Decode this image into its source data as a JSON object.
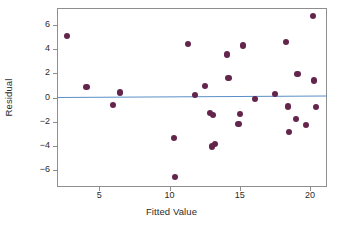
{
  "chart_data": {
    "type": "scatter",
    "title": "",
    "xlabel": "Fitted Value",
    "ylabel": "Residual",
    "xlim": [
      2.0,
      21.2
    ],
    "ylim": [
      -7.4,
      7.4
    ],
    "xticks": [
      5,
      10,
      15,
      20
    ],
    "yticks": [
      6,
      4,
      2,
      0,
      -2,
      -4,
      -6
    ],
    "grid": false,
    "legend": null,
    "point_color": "#63254b",
    "line_color": "#5a8fc7",
    "frame_color": "#8e8e8e",
    "points": [
      {
        "x": 2.7,
        "y": 5.1
      },
      {
        "x": 4.1,
        "y": 0.9
      },
      {
        "x": 6.0,
        "y": -0.65
      },
      {
        "x": 6.5,
        "y": 0.42
      },
      {
        "x": 10.3,
        "y": -3.35
      },
      {
        "x": 10.4,
        "y": -6.55
      },
      {
        "x": 11.3,
        "y": 4.45
      },
      {
        "x": 11.8,
        "y": 0.2
      },
      {
        "x": 12.5,
        "y": 0.95
      },
      {
        "x": 12.9,
        "y": -1.3
      },
      {
        "x": 13.1,
        "y": -1.45
      },
      {
        "x": 13.0,
        "y": -4.05
      },
      {
        "x": 13.25,
        "y": -3.85
      },
      {
        "x": 14.1,
        "y": 3.55
      },
      {
        "x": 14.2,
        "y": 1.6
      },
      {
        "x": 14.9,
        "y": -2.2
      },
      {
        "x": 15.0,
        "y": -1.35
      },
      {
        "x": 15.2,
        "y": 4.3
      },
      {
        "x": 16.1,
        "y": -0.15
      },
      {
        "x": 17.5,
        "y": 0.3
      },
      {
        "x": 18.3,
        "y": 4.6
      },
      {
        "x": 18.4,
        "y": -0.75
      },
      {
        "x": 18.5,
        "y": -2.85
      },
      {
        "x": 19.0,
        "y": -1.8
      },
      {
        "x": 19.1,
        "y": 1.95
      },
      {
        "x": 19.7,
        "y": -2.25
      },
      {
        "x": 20.2,
        "y": 6.75
      },
      {
        "x": 20.3,
        "y": 1.4
      },
      {
        "x": 20.4,
        "y": -0.8
      }
    ],
    "reference_line": {
      "name": "zero-residual-trend-line",
      "x_start": 2.0,
      "y_start": 0.02,
      "x_end": 21.2,
      "y_end": 0.14
    }
  }
}
